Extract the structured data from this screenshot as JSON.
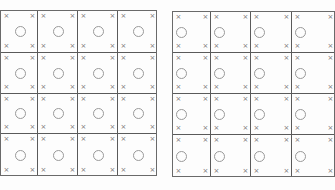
{
  "diagram": {
    "marker_glyph": "×",
    "colors": {
      "grid_line": "#5a5a5a",
      "marker": "#777777",
      "circle": "#999999",
      "background": "#fdfdfd"
    },
    "grids": [
      {
        "name": "left-grid",
        "rows": 4,
        "cols": 4,
        "box": {
          "x": 0,
          "y": 10,
          "w": 157,
          "h": 166
        },
        "col_edges": [
          0,
          37,
          77,
          117,
          157
        ],
        "row_edges": [
          0,
          42,
          83,
          123,
          166
        ],
        "circle_position": "center"
      },
      {
        "name": "right-grid",
        "rows": 4,
        "cols": 4,
        "box": {
          "x": 172,
          "y": 11,
          "w": 163,
          "h": 166
        },
        "col_edges": [
          0,
          38,
          78,
          119,
          163
        ],
        "row_edges": [
          0,
          41,
          82,
          123,
          166
        ],
        "circle_position": "left"
      }
    ]
  }
}
